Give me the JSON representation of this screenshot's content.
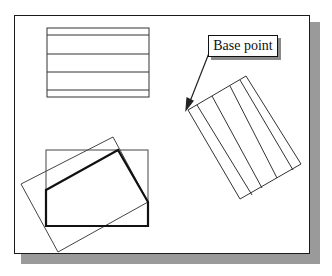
{
  "diagram": {
    "label": "Base point",
    "colors": {
      "line": "#222222",
      "shadow": "#9a9a9a",
      "background": "#ffffff"
    }
  }
}
